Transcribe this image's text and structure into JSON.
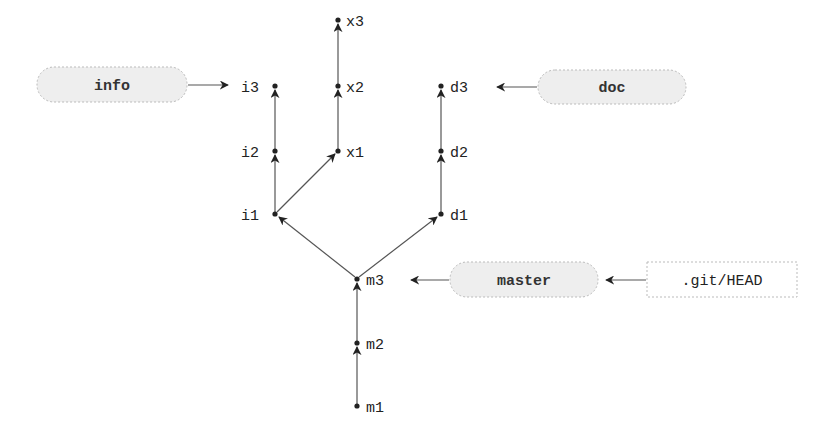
{
  "diagram": {
    "type": "git-commit-graph",
    "commits": {
      "m1": "m1",
      "m2": "m2",
      "m3": "m3",
      "i1": "i1",
      "i2": "i2",
      "i3": "i3",
      "x1": "x1",
      "x2": "x2",
      "x3": "x3",
      "d1": "d1",
      "d2": "d2",
      "d3": "d3"
    },
    "refs": {
      "info": "info",
      "doc": "doc",
      "master": "master",
      "head": ".git/HEAD"
    },
    "edges": [
      [
        "m1",
        "m2"
      ],
      [
        "m2",
        "m3"
      ],
      [
        "m3",
        "i1"
      ],
      [
        "m3",
        "d1"
      ],
      [
        "i1",
        "i2"
      ],
      [
        "i2",
        "i3"
      ],
      [
        "i1",
        "x1"
      ],
      [
        "x1",
        "x2"
      ],
      [
        "x2",
        "x3"
      ],
      [
        "d1",
        "d2"
      ],
      [
        "d2",
        "d3"
      ]
    ],
    "ref_pointers": [
      [
        "info",
        "i3"
      ],
      [
        "doc",
        "d3"
      ],
      [
        "master",
        "m3"
      ],
      [
        ".git/HEAD",
        "master"
      ]
    ],
    "colors": {
      "edge": "#555555",
      "node": "#222222",
      "pill_fill": "#eeeeee",
      "pill_border": "#bbbbbb"
    }
  }
}
